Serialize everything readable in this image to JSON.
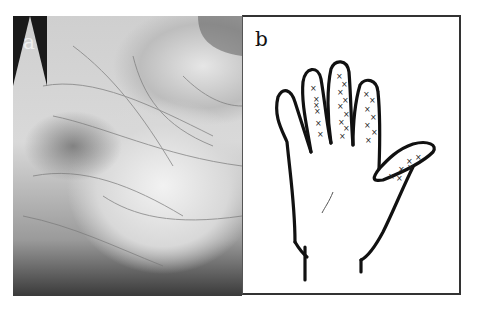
{
  "figure": {
    "panels": [
      {
        "label": "a",
        "description": "Photograph of palm showing skin creases/lesions",
        "type": "photo"
      },
      {
        "label": "b",
        "description": "Line drawing of hand outline with x marks on fingers and thumb",
        "type": "drawing",
        "marker_symbol": "×"
      }
    ]
  },
  "colors": {
    "ink": "#111111",
    "paper": "#ffffff",
    "photo_dark": "#1a1a1a"
  }
}
